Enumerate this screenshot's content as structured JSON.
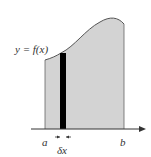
{
  "diagram": {
    "function_label": "y = f(x)",
    "lower_limit_label": "a",
    "upper_limit_label": "b",
    "strip_width_label": "δx",
    "colors": {
      "area_fill": "#d3d3d3",
      "curve": "#555555",
      "strip": "#000000",
      "axis": "#333333",
      "background": "#ffffff"
    }
  }
}
